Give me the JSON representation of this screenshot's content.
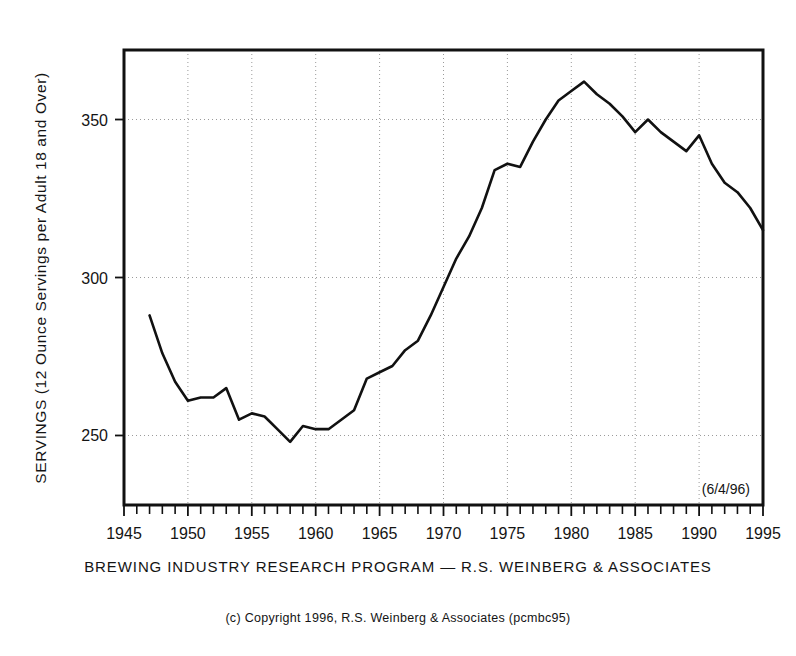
{
  "chart_data": {
    "type": "line",
    "title": "",
    "xlabel": "",
    "ylabel": "SERVINGS (12 Ounce Servings per Adult 18 and Over)",
    "xlim": [
      1945,
      1995
    ],
    "ylim": [
      228,
      372
    ],
    "grid": true,
    "legend": null,
    "yticks": [
      250,
      300,
      350
    ],
    "ytick_labels": [
      "250",
      "300",
      "350"
    ],
    "xticks": [
      1945,
      1950,
      1955,
      1960,
      1965,
      1970,
      1975,
      1980,
      1985,
      1990,
      1995
    ],
    "xtick_labels": [
      "1945",
      "1950",
      "1955",
      "1960",
      "1965",
      "1970",
      "1975",
      "1980",
      "1985",
      "1990",
      "1995"
    ],
    "x": [
      1947,
      1948,
      1949,
      1950,
      1951,
      1952,
      1953,
      1954,
      1955,
      1956,
      1957,
      1958,
      1959,
      1960,
      1961,
      1962,
      1963,
      1964,
      1965,
      1966,
      1967,
      1968,
      1969,
      1970,
      1971,
      1972,
      1973,
      1974,
      1975,
      1976,
      1977,
      1978,
      1979,
      1980,
      1981,
      1982,
      1983,
      1984,
      1985,
      1986,
      1987,
      1988,
      1989,
      1990,
      1991,
      1992,
      1993,
      1994,
      1995
    ],
    "values": [
      288,
      276,
      267,
      261,
      262,
      262,
      265,
      255,
      257,
      256,
      252,
      248,
      253,
      252,
      252,
      255,
      258,
      268,
      270,
      272,
      277,
      280,
      288,
      297,
      306,
      313,
      322,
      334,
      336,
      335,
      343,
      350,
      356,
      359,
      362,
      358,
      355,
      351,
      346,
      350,
      346,
      343,
      340,
      345,
      336,
      330,
      327,
      322,
      315
    ],
    "series": [
      {
        "name": "Servings per adult 18 and over",
        "values": [
          288,
          276,
          267,
          261,
          262,
          262,
          265,
          255,
          257,
          256,
          252,
          248,
          253,
          252,
          252,
          255,
          258,
          268,
          270,
          272,
          277,
          280,
          288,
          297,
          306,
          313,
          322,
          334,
          336,
          335,
          343,
          350,
          356,
          359,
          362,
          358,
          355,
          351,
          346,
          350,
          346,
          343,
          340,
          345,
          336,
          330,
          327,
          322,
          315
        ]
      }
    ],
    "annotations": [
      "(6/4/96)"
    ]
  },
  "axis": {
    "ylabel": "SERVINGS (12 Ounce Servings per Adult 18 and Over)",
    "ytick_labels": [
      "350",
      "300",
      "250"
    ],
    "xtick_labels": [
      "1945",
      "1950",
      "1955",
      "1960",
      "1965",
      "1970",
      "1975",
      "1980",
      "1985",
      "1990",
      "1995"
    ]
  },
  "annotations": {
    "datestamp": "(6/4/96)"
  },
  "captions": {
    "source": "BREWING INDUSTRY RESEARCH PROGRAM  —  R.S. WEINBERG & ASSOCIATES",
    "copyright": "(c) Copyright  1996, R.S. Weinberg  &  Associates  (pcmbc95)"
  },
  "colors": {
    "line": "#111111",
    "grid": "#9a9a9a",
    "frame": "#111111",
    "text": "#141414",
    "background": "#ffffff"
  }
}
